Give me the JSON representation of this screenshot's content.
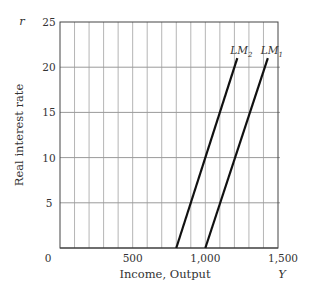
{
  "chart_data": {
    "type": "line",
    "title": "",
    "xlabel": "Income, Output",
    "xlabel_symbol": "Y",
    "ylabel": "Real interest rate",
    "ylabel_symbol": "r",
    "xlim": [
      0,
      1500
    ],
    "ylim": [
      0,
      25
    ],
    "x_ticks": [
      0,
      500,
      1000,
      1500
    ],
    "x_tick_labels": [
      "0",
      "500",
      "1,000",
      "1,500"
    ],
    "x_grid_step": 100,
    "y_ticks": [
      5,
      10,
      15,
      20,
      25
    ],
    "y_tick_labels": [
      "5",
      "10",
      "15",
      "20",
      "25"
    ],
    "grid": true,
    "legend": "inline labels at line tops",
    "series": [
      {
        "name": "LM2",
        "label_main": "LM",
        "label_sub": "2",
        "x": [
          800,
          1220
        ],
        "y": [
          0,
          21
        ]
      },
      {
        "name": "LM1",
        "label_main": "LM",
        "label_sub": "1",
        "x": [
          1000,
          1430
        ],
        "y": [
          0,
          21
        ]
      }
    ]
  },
  "labels": {
    "origin": "0"
  }
}
